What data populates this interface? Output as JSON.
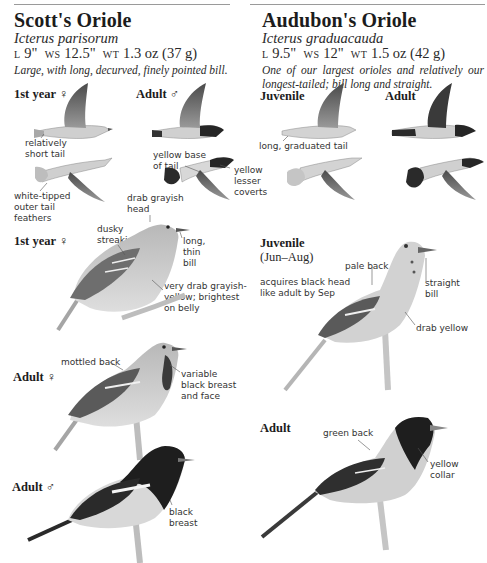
{
  "left": {
    "title": "Scott's Oriole",
    "scientific": "Icterus parisorum",
    "measurements": {
      "l_label": "L",
      "l": "9\"",
      "ws_label": "WS",
      "ws": "12.5\"",
      "wt_label": "WT",
      "wt": "1.3 oz (37 g)"
    },
    "description": "Large, with long, decurved, finely pointed bill.",
    "flight_labels": {
      "first_year_female": "1st year ♀",
      "adult_male": "Adult ♂",
      "short_tail": [
        "relatively",
        "short tail"
      ],
      "white_tipped": [
        "white-tipped",
        "outer tail",
        "feathers"
      ],
      "yellow_base": [
        "yellow base",
        "of tail"
      ],
      "yellow_lesser": [
        "yellow",
        "lesser",
        "coverts"
      ]
    },
    "perched": [
      {
        "age": "1st year ♀",
        "labels": {
          "head": [
            "drab grayish",
            "head"
          ],
          "streaking": [
            "dusky",
            "streaking"
          ],
          "bill": [
            "long,",
            "thin",
            "bill"
          ],
          "belly": [
            "very drab grayish-",
            "yellow; brightest",
            "on belly"
          ]
        }
      },
      {
        "age": "Adult ♀",
        "labels": {
          "back": [
            "mottled back"
          ],
          "breast": [
            "variable",
            "black breast",
            "and face"
          ]
        }
      },
      {
        "age": "Adult ♂",
        "labels": {
          "breast": [
            "black",
            "breast"
          ]
        }
      }
    ]
  },
  "right": {
    "title": "Audubon's Oriole",
    "scientific": "Icterus graduacauda",
    "measurements": {
      "l_label": "L",
      "l": "9.5\"",
      "ws_label": "WS",
      "ws": "12\"",
      "wt_label": "WT",
      "wt": "1.5 oz (42 g)"
    },
    "description": "One of our largest orioles and relatively our longest-tailed; bill long and straight.",
    "flight_labels": {
      "juvenile": "Juvenile",
      "adult": "Adult",
      "graduated_tail": "long, graduated tail"
    },
    "perched": [
      {
        "age": "Juvenile",
        "subtitle": "(Jun–Aug)",
        "labels": {
          "black_head": [
            "acquires black head",
            "like adult by Sep"
          ],
          "back": [
            "pale back"
          ],
          "bill": [
            "straight",
            "bill"
          ],
          "belly": [
            "drab yellow"
          ]
        }
      },
      {
        "age": "Adult",
        "labels": {
          "back": [
            "green back"
          ],
          "collar": [
            "yellow",
            "collar"
          ]
        }
      }
    ]
  },
  "colors": {
    "ink": "#1c1c1c",
    "rule": "#9a9a9a",
    "bird_light": "#c9c9c9",
    "bird_mid": "#8f8f8f",
    "bird_dark": "#2a2a2a",
    "branch": "#bdbdbd"
  }
}
